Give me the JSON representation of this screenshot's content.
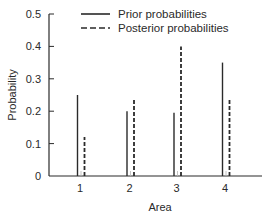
{
  "chart_data": {
    "type": "bar",
    "title": "",
    "xlabel": "Area",
    "ylabel": "Probability",
    "categories": [
      "1",
      "2",
      "3",
      "4"
    ],
    "series": [
      {
        "name": "Prior probabilities",
        "style": "solid",
        "values": [
          0.25,
          0.2,
          0.195,
          0.35
        ]
      },
      {
        "name": "Posterior probabilities",
        "style": "dashed",
        "values": [
          0.12,
          0.24,
          0.4,
          0.24
        ]
      }
    ],
    "ylim": [
      0,
      0.5
    ],
    "yticks": [
      0,
      0.1,
      0.2,
      0.3,
      0.4,
      0.5
    ],
    "ytick_labels": [
      "0",
      "0.1",
      "0.2",
      "0.3",
      "0.4",
      "0.5"
    ],
    "grid": false,
    "legend": "top-center",
    "color": "#2a2a2a"
  }
}
